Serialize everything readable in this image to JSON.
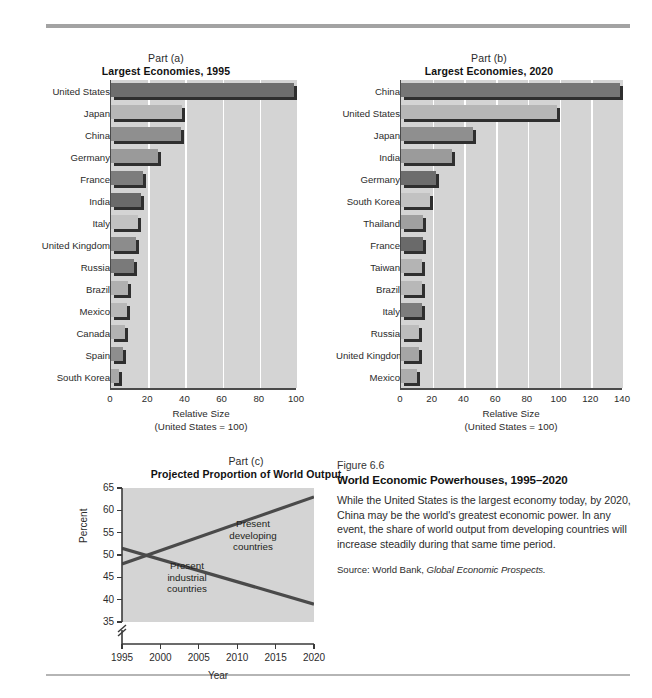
{
  "figure": {
    "number_line": "Figure 6.6",
    "title": "World Economic Powerhouses, 1995–2020",
    "body": "While the United States is the largest economy today, by 2020, China may be the world's greatest economic power. In any event, the share of world output from developing countries will increase steadily during that same time period.",
    "source_prefix": "Source:",
    "source_publisher": "World Bank,",
    "source_work": "Global Economic Prospects."
  },
  "chart_data": [
    {
      "id": "part-a",
      "type": "bar",
      "orientation": "horizontal",
      "part_label": "Part (a)",
      "title": "Largest Economies, 1995",
      "xlabel": "Relative Size",
      "xlabel_sub": "(United States = 100)",
      "ylabel": "",
      "xlim": [
        0,
        100
      ],
      "xticks": [
        0,
        20,
        40,
        60,
        80,
        100
      ],
      "grid": true,
      "categories": [
        "United States",
        "Japan",
        "China",
        "Germany",
        "France",
        "India",
        "Italy",
        "United Kingdom",
        "Russia",
        "Brazil",
        "Mexico",
        "Canada",
        "Spain",
        "South Korea"
      ],
      "values": [
        100,
        40,
        39,
        27,
        19,
        18,
        16,
        15,
        14,
        11,
        10,
        9,
        8,
        6
      ],
      "colors": [
        "#6e6e6e",
        "#b6b6b6",
        "#8f8f8f",
        "#9a9a9a",
        "#7d7d7d",
        "#6a6a6a",
        "#c2c2c2",
        "#8c8c8c",
        "#7a7a7a",
        "#b0b0b0",
        "#b8b8b8",
        "#b2b2b2",
        "#8e8e8e",
        "#a8a8a8"
      ]
    },
    {
      "id": "part-b",
      "type": "bar",
      "orientation": "horizontal",
      "part_label": "Part (b)",
      "title": "Largest Economies, 2020",
      "xlabel": "Relative Size",
      "xlabel_sub": "(United States = 100)",
      "ylabel": "",
      "xlim": [
        0,
        140
      ],
      "xticks": [
        0,
        20,
        40,
        60,
        80,
        100,
        120,
        140
      ],
      "grid": true,
      "categories": [
        "China",
        "United States",
        "Japan",
        "India",
        "Germany",
        "South Korea",
        "Thailand",
        "France",
        "Taiwan",
        "Brazil",
        "Italy",
        "Russia",
        "United Kingdom",
        "Mexico"
      ],
      "values": [
        140,
        100,
        47,
        34,
        24,
        20,
        16,
        16,
        15,
        15,
        15,
        13,
        13,
        12
      ],
      "colors": [
        "#767676",
        "#b6b6b6",
        "#8f8f8f",
        "#9b9b9b",
        "#6d6d6d",
        "#c2c2c2",
        "#a0a0a0",
        "#6a6a6a",
        "#b4b4b4",
        "#b8b8b8",
        "#7d7d7d",
        "#bdbdbd",
        "#a5a5a5",
        "#adadad"
      ]
    },
    {
      "id": "part-c",
      "type": "line",
      "part_label": "Part (c)",
      "title": "Projected Proportion of World Output",
      "xlabel": "Year",
      "ylabel": "Percent",
      "xlim": [
        1995,
        2020
      ],
      "ylim": [
        35,
        65
      ],
      "yticks": [
        35,
        40,
        45,
        50,
        55,
        60,
        65
      ],
      "xticks": [
        1995,
        2000,
        2005,
        2010,
        2015,
        2020
      ],
      "axis_break": true,
      "grid": false,
      "series": [
        {
          "name": "Present developing countries",
          "x": [
            1995,
            2020
          ],
          "values": [
            48,
            63
          ],
          "label_lines": [
            "Present",
            "developing",
            "countries"
          ]
        },
        {
          "name": "Present industrial countries",
          "x": [
            1995,
            2020
          ],
          "values": [
            51.5,
            39
          ],
          "label_lines": [
            "Present",
            "industrial",
            "countries"
          ]
        }
      ]
    }
  ]
}
